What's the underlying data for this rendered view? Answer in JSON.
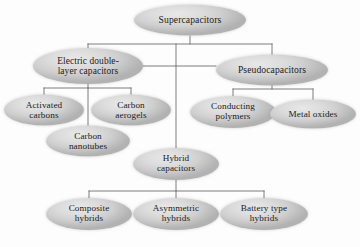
{
  "diagram": {
    "type": "hierarchy-tree",
    "background_color": "#fdfdfd",
    "node_fill_color": "#d3d3d3",
    "node_text_color": "#1b1b20",
    "edge_color": "#6e6e73",
    "nodes": [
      {
        "id": "supercapacitors",
        "label": "Supercapacitors",
        "level": 0,
        "cx": 190,
        "cy": 20,
        "w": 112,
        "h": 31,
        "font_size": 9.6
      },
      {
        "id": "edlc",
        "label": "Electric double-\nlayer capacitors",
        "level": 1,
        "cx": 88,
        "cy": 66,
        "w": 110,
        "h": 36,
        "font_size": 9.4
      },
      {
        "id": "pseudocapacitors",
        "label": "Pseudocapacitors",
        "level": 1,
        "cx": 272,
        "cy": 70,
        "w": 112,
        "h": 31,
        "font_size": 9.6
      },
      {
        "id": "activated-carbons",
        "label": "Activated\ncarbons",
        "level": 2,
        "cx": 44,
        "cy": 110,
        "w": 80,
        "h": 31,
        "font_size": 9.2
      },
      {
        "id": "carbon-aerogels",
        "label": "Carbon\naerogels",
        "level": 2,
        "cx": 131,
        "cy": 110,
        "w": 80,
        "h": 31,
        "font_size": 9.2
      },
      {
        "id": "carbon-nanotubes",
        "label": "Carbon\nnanotubes",
        "level": 2,
        "cx": 88,
        "cy": 141,
        "w": 84,
        "h": 31,
        "font_size": 9.2
      },
      {
        "id": "conducting-polymers",
        "label": "Conducting\npolymers",
        "level": 2,
        "cx": 233,
        "cy": 112,
        "w": 86,
        "h": 32,
        "font_size": 9.2
      },
      {
        "id": "metal-oxides",
        "label": "Metal oxides",
        "level": 2,
        "cx": 313,
        "cy": 114,
        "w": 86,
        "h": 29,
        "font_size": 9.2
      },
      {
        "id": "hybrid-capacitors",
        "label": "Hybrid\ncapacitors",
        "level": 1,
        "cx": 176,
        "cy": 164,
        "w": 86,
        "h": 32,
        "font_size": 9.2
      },
      {
        "id": "composite-hybrids",
        "label": "Composite\nhybrids",
        "level": 2,
        "cx": 89,
        "cy": 214,
        "w": 86,
        "h": 32,
        "font_size": 9.2
      },
      {
        "id": "asymmetric-hybrids",
        "label": "Asymmetric\nhybrids",
        "level": 2,
        "cx": 176,
        "cy": 214,
        "w": 86,
        "h": 32,
        "font_size": 9.2
      },
      {
        "id": "battery-type-hybrids",
        "label": "Battery type\nhybrids",
        "level": 2,
        "cx": 264,
        "cy": 214,
        "w": 88,
        "h": 32,
        "font_size": 9.2
      }
    ],
    "edges": [
      {
        "id": "root-stem",
        "from": "supercapacitors",
        "to": "level1-bus",
        "path": "M190,36 L190,44"
      },
      {
        "id": "level1-bus",
        "from": "root-stem",
        "to": "level1-children",
        "path": "M88,44 L272,44"
      },
      {
        "id": "edlc-stem",
        "from": "level1-bus",
        "to": "edlc",
        "path": "M88,44 L88,50"
      },
      {
        "id": "pseudo-stem",
        "from": "level1-bus",
        "to": "pseudocapacitors",
        "path": "M272,44 L272,56"
      },
      {
        "id": "center-trunk",
        "from": "level1-bus",
        "to": "hybrid-capacitors",
        "path": "M176,44 L176,149"
      },
      {
        "id": "edlc-pseudo-link",
        "from": "edlc",
        "to": "pseudocapacitors",
        "path": "M143,66 L216,66"
      },
      {
        "id": "edlc-child-stem",
        "from": "edlc",
        "to": "edlc-bus",
        "path": "M88,82 L88,88"
      },
      {
        "id": "edlc-bus",
        "from": "edlc-child-stem",
        "to": "edlc-children",
        "path": "M44,88 L131,88"
      },
      {
        "id": "activated-stem",
        "from": "edlc-bus",
        "to": "activated-carbons",
        "path": "M44,88 L44,96"
      },
      {
        "id": "aerogels-stem",
        "from": "edlc-bus",
        "to": "carbon-aerogels",
        "path": "M131,88 L131,96"
      },
      {
        "id": "nanotubes-stem",
        "from": "edlc-bus",
        "to": "carbon-nanotubes",
        "path": "M88,88 L88,127"
      },
      {
        "id": "pseudo-child-stem",
        "from": "pseudocapacitors",
        "to": "pseudo-bus",
        "path": "M272,84 L272,89"
      },
      {
        "id": "pseudo-bus",
        "from": "pseudo-child-stem",
        "to": "pseudo-children",
        "path": "M233,89 L313,89"
      },
      {
        "id": "conducting-stem",
        "from": "pseudo-bus",
        "to": "conducting-polymers",
        "path": "M233,89 L233,97"
      },
      {
        "id": "metal-oxides-stem",
        "from": "pseudo-bus",
        "to": "metal-oxides",
        "path": "M313,89 L313,100"
      },
      {
        "id": "hybrid-child-stem",
        "from": "hybrid-capacitors",
        "to": "hybrid-bus",
        "path": "M176,180 L176,191"
      },
      {
        "id": "hybrid-bus",
        "from": "hybrid-child-stem",
        "to": "hybrid-children",
        "path": "M89,191 L264,191"
      },
      {
        "id": "composite-stem",
        "from": "hybrid-bus",
        "to": "composite-hybrids",
        "path": "M89,191 L89,199"
      },
      {
        "id": "asymmetric-stem",
        "from": "hybrid-bus",
        "to": "asymmetric-hybrids",
        "path": "M176,191 L176,199"
      },
      {
        "id": "battery-stem",
        "from": "hybrid-bus",
        "to": "battery-type-hybrids",
        "path": "M264,191 L264,199"
      }
    ]
  }
}
